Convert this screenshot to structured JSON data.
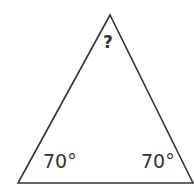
{
  "diagram": {
    "type": "triangle",
    "stroke_color": "#333333",
    "background": "#ffffff",
    "vertices": {
      "apex": [
        110,
        15
      ],
      "bottom_left": [
        18,
        183
      ],
      "bottom_right": [
        193,
        183
      ]
    },
    "labels": {
      "apex_angle": "?",
      "bottom_left_angle": "70°",
      "bottom_right_angle": "70°"
    }
  }
}
